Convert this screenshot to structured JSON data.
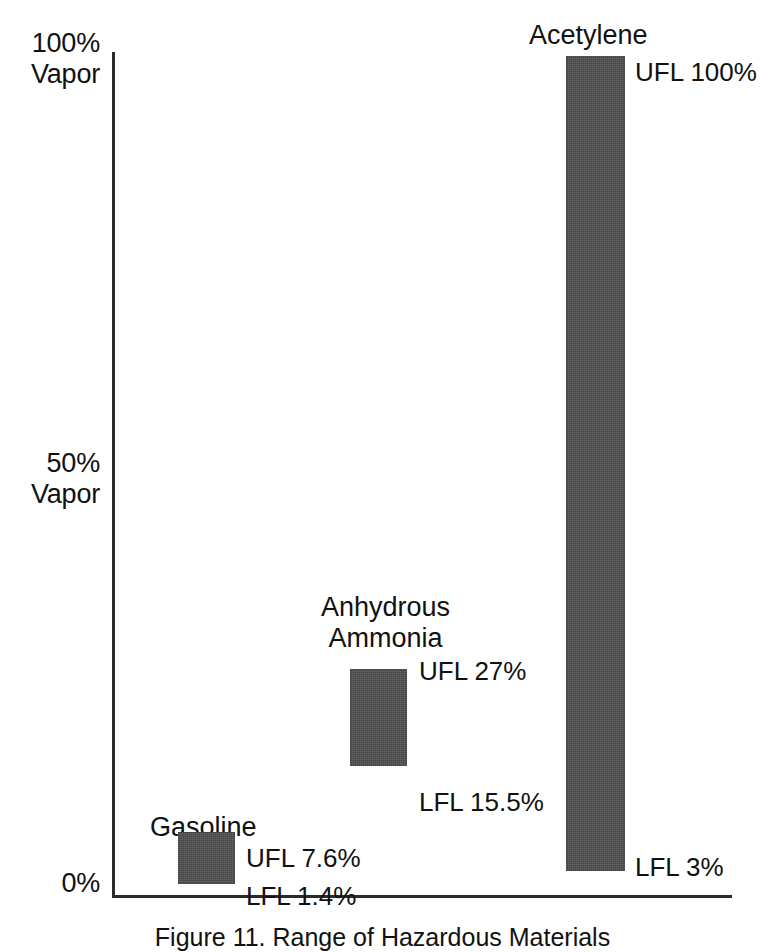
{
  "figure": {
    "caption": "Figure 11. Range of Hazardous Materials",
    "axis": {
      "y_ticks": [
        {
          "line1": "100%",
          "line2": "Vapor",
          "value": 100
        },
        {
          "line1": "50%",
          "line2": "Vapor",
          "value": 50
        },
        {
          "line1": "0%",
          "line2": "",
          "value": 0
        }
      ],
      "x_label": ""
    },
    "bar_color": "#4c4c4c",
    "axis_color": "#2b2b2b"
  },
  "series": [
    {
      "name": "Gasoline",
      "name_line1": "Gasoline",
      "name_line2": "",
      "lfl": 1.4,
      "ufl": 7.6,
      "ufl_label": "UFL 7.6%",
      "lfl_label": "LFL 1.4%"
    },
    {
      "name": "Anhydrous Ammonia",
      "name_line1": "Anhydrous",
      "name_line2": "Ammonia",
      "lfl": 15.5,
      "ufl": 27,
      "ufl_label": "UFL 27%",
      "lfl_label": "LFL 15.5%"
    },
    {
      "name": "Acetylene",
      "name_line1": "Acetylene",
      "name_line2": "",
      "lfl": 3,
      "ufl": 100,
      "ufl_label": "UFL 100%",
      "lfl_label": "LFL 3%"
    }
  ],
  "chart_data": {
    "type": "bar",
    "title": "Figure 11. Range of Hazardous Materials",
    "subtitle": "",
    "xlabel": "",
    "ylabel": "",
    "ylim": [
      0,
      100
    ],
    "y_tick_values": [
      0,
      50,
      100
    ],
    "y_tick_labels": [
      "0%",
      "50% Vapor",
      "100% Vapor"
    ],
    "grid": false,
    "legend": "none",
    "orientation": "vertical",
    "bar_style": "floating-range",
    "categories": [
      "Gasoline",
      "Anhydrous Ammonia",
      "Acetylene"
    ],
    "series": [
      {
        "name": "LFL",
        "values": [
          1.4,
          15.5,
          3
        ]
      },
      {
        "name": "UFL",
        "values": [
          7.6,
          27,
          100
        ]
      }
    ],
    "annotations": [
      {
        "text": "Gasoline",
        "category": "Gasoline",
        "kind": "series-name"
      },
      {
        "text": "UFL 7.6%",
        "category": "Gasoline",
        "value": 7.6
      },
      {
        "text": "LFL 1.4%",
        "category": "Gasoline",
        "value": 1.4
      },
      {
        "text": "Anhydrous Ammonia",
        "category": "Anhydrous Ammonia",
        "kind": "series-name"
      },
      {
        "text": "UFL 27%",
        "category": "Anhydrous Ammonia",
        "value": 27
      },
      {
        "text": "LFL 15.5%",
        "category": "Anhydrous Ammonia",
        "value": 15.5
      },
      {
        "text": "Acetylene",
        "category": "Acetylene",
        "kind": "series-name"
      },
      {
        "text": "UFL 100%",
        "category": "Acetylene",
        "value": 100
      },
      {
        "text": "LFL 3%",
        "category": "Acetylene",
        "value": 3
      }
    ]
  }
}
